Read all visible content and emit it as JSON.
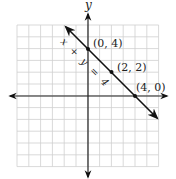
{
  "chart_data": {
    "type": "line",
    "title": "",
    "xlabel": "",
    "ylabel": "y",
    "xlim": [
      -6,
      6
    ],
    "ylim": [
      -6,
      6
    ],
    "grid": true,
    "series": [
      {
        "name": "x + y = 4",
        "equation": "x + y = 4",
        "points": [
          {
            "x": 0,
            "y": 4,
            "label": "(0, 4)"
          },
          {
            "x": 2,
            "y": 2,
            "label": "(2, 2)"
          },
          {
            "x": 4,
            "y": 0,
            "label": "(4, 0)"
          }
        ]
      }
    ],
    "annotations": [
      "(0, 4)",
      "(2, 2)",
      "(4, 0)",
      "x + y = 4"
    ]
  },
  "axes": {
    "y_label": "y"
  },
  "colors": {
    "grid": "#c8c8c8",
    "axis": "#222222",
    "line": "#111111"
  }
}
